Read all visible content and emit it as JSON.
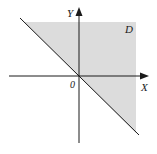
{
  "diagram": {
    "axes": {
      "x_label": "X",
      "y_label": "Y",
      "origin_label": "0"
    },
    "region": {
      "label": "D",
      "boundary_line": "y = -x",
      "fill_color": "#dcdcdc"
    },
    "colors": {
      "axis": "#1a1a1a",
      "line": "#1a1a1a",
      "background": "#ffffff"
    }
  }
}
